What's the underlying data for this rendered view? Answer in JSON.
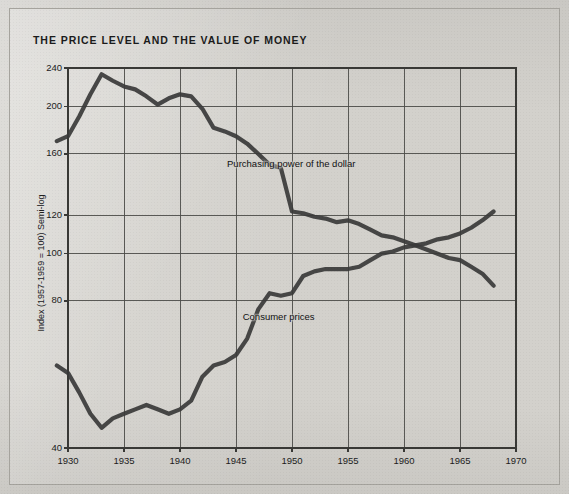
{
  "page": {
    "title": "THE PRICE LEVEL AND THE VALUE OF MONEY",
    "paper_color": "#d3d1cc",
    "ink_color": "#3a3a3a"
  },
  "chart_data": {
    "type": "line",
    "title": "THE PRICE LEVEL AND THE VALUE OF MONEY",
    "xlabel": "",
    "ylabel": "Index (1957-1959 = 100) Semi-log",
    "yscale": "log",
    "xlim": [
      1930,
      1970
    ],
    "ylim": [
      40,
      240
    ],
    "ytick_labels": [
      "240",
      "200",
      "160",
      "120",
      "100",
      "80",
      "40"
    ],
    "ytick_values": [
      240,
      200,
      160,
      120,
      100,
      80,
      40
    ],
    "xtick_labels": [
      "1930",
      "1935",
      "1940",
      "1945",
      "1950",
      "1955",
      "1960",
      "1965",
      "1970"
    ],
    "xtick_values": [
      1930,
      1935,
      1940,
      1945,
      1950,
      1955,
      1960,
      1965,
      1970
    ],
    "grid": true,
    "legend": "inline-annotations",
    "annotations": [
      {
        "text": "Purchasing power of the dollar",
        "x": 1944.2,
        "y": 152
      },
      {
        "text": "Consumer prices",
        "x": 1945.6,
        "y": 74
      }
    ],
    "series": [
      {
        "name": "Purchasing power of the dollar",
        "color": "#3a3a3a",
        "x": [
          1929,
          1930,
          1931,
          1932,
          1933,
          1934,
          1935,
          1936,
          1937,
          1938,
          1939,
          1940,
          1941,
          1942,
          1943,
          1944,
          1945,
          1946,
          1947,
          1948,
          1949,
          1950,
          1951,
          1952,
          1953,
          1954,
          1955,
          1956,
          1957,
          1958,
          1959,
          1960,
          1961,
          1962,
          1963,
          1964,
          1965,
          1966,
          1967,
          1968
        ],
        "values": [
          170,
          174,
          191,
          212,
          233,
          226,
          220,
          217,
          210,
          202,
          208,
          212,
          210,
          198,
          181,
          178,
          174,
          168,
          160,
          152,
          150,
          122,
          121,
          119,
          118,
          116,
          117,
          115,
          112,
          109,
          108,
          106,
          104,
          102,
          100,
          98,
          97,
          94,
          91,
          86
        ]
      },
      {
        "name": "Consumer prices",
        "color": "#3a3a3a",
        "x": [
          1929,
          1930,
          1931,
          1932,
          1933,
          1934,
          1935,
          1936,
          1937,
          1938,
          1939,
          1940,
          1941,
          1942,
          1943,
          1944,
          1945,
          1946,
          1947,
          1948,
          1949,
          1950,
          1951,
          1952,
          1953,
          1954,
          1955,
          1956,
          1957,
          1958,
          1959,
          1960,
          1961,
          1962,
          1963,
          1964,
          1965,
          1966,
          1967,
          1968
        ],
        "values": [
          59,
          57,
          52,
          47,
          44,
          46,
          47,
          48,
          49,
          48,
          47,
          48,
          50,
          56,
          59,
          60,
          62,
          67,
          77,
          83,
          82,
          83,
          90,
          92,
          93,
          93,
          93,
          94,
          97,
          100,
          101,
          103,
          104,
          105,
          107,
          108,
          110,
          113,
          117,
          122
        ]
      }
    ]
  }
}
